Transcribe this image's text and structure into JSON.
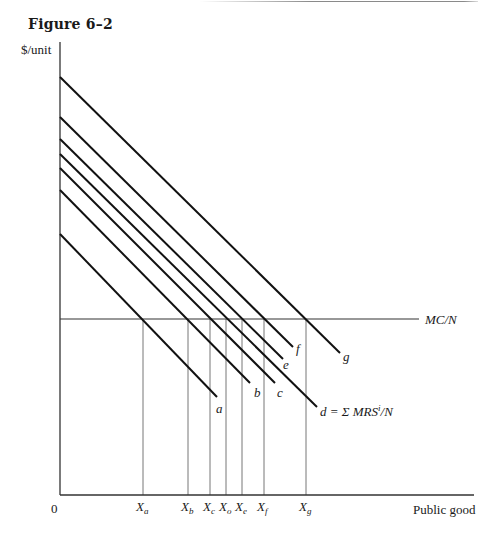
{
  "figure": {
    "title": "Figure 6–2",
    "ylabel": "$/unit",
    "xlabel": "Public good",
    "origin_label": "0",
    "mc_label": "MC/N",
    "d_label_formula": "d = Σ MRS",
    "d_label_sup": "i",
    "d_label_tail": "/N"
  },
  "chart_data": {
    "type": "line",
    "title": "Figure 6–2",
    "xlabel": "Public good",
    "ylabel": "$/unit",
    "grid": false,
    "note": "Pixel-space coordinates; y-axis at x=60, x-axis at y=495, MC/N horizontal at y=319",
    "axes": {
      "x0": 60,
      "y0": 495,
      "x_end": 474,
      "y_top": 42
    },
    "mc_line": {
      "label": "MC/N",
      "y": 319,
      "x_start": 60,
      "x_end": 419
    },
    "series": [
      {
        "name": "a",
        "x1": 60,
        "y1": 234,
        "x2": 217,
        "y2": 397,
        "label_x": 216,
        "label_y": 413
      },
      {
        "name": "b",
        "x1": 60,
        "y1": 190,
        "x2": 250,
        "y2": 383,
        "label_x": 254,
        "label_y": 397
      },
      {
        "name": "c",
        "x1": 60,
        "y1": 168,
        "x2": 275,
        "y2": 383,
        "label_x": 277,
        "label_y": 397
      },
      {
        "name": "d = Σ MRSⁱ/N",
        "x1": 60,
        "y1": 154,
        "x2": 317,
        "y2": 407,
        "label_x": 320,
        "label_y": 416
      },
      {
        "name": "e",
        "x1": 60,
        "y1": 139,
        "x2": 283,
        "y2": 359,
        "label_x": 283,
        "label_y": 369
      },
      {
        "name": "f",
        "x1": 60,
        "y1": 117,
        "x2": 293,
        "y2": 347,
        "label_x": 296,
        "label_y": 353
      },
      {
        "name": "g",
        "x1": 60,
        "y1": 77,
        "x2": 340,
        "y2": 353,
        "label_x": 343,
        "label_y": 361
      }
    ],
    "x_ticks": [
      {
        "main": "X",
        "sub": "a",
        "x": 143
      },
      {
        "main": "X",
        "sub": "b",
        "x": 188
      },
      {
        "main": "X",
        "sub": "c",
        "x": 210
      },
      {
        "main": "X",
        "sub": "o",
        "x": 226
      },
      {
        "main": "X",
        "sub": "e",
        "x": 242
      },
      {
        "main": "X",
        "sub": "f",
        "x": 264
      },
      {
        "main": "X",
        "sub": "g",
        "x": 306
      }
    ]
  }
}
